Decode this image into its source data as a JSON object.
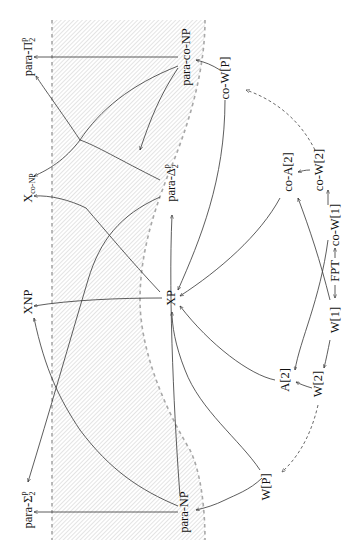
{
  "diagram": {
    "title": "",
    "orientation": "rotated-90",
    "colors": {
      "edge": "#333333",
      "boundary": "#a8a8a8",
      "hatch": "#c8c8c8",
      "text": "#111111"
    },
    "nodes": {
      "para_pi2p": {
        "base": "para-Π",
        "sub": "2",
        "sup": "p"
      },
      "xconp": {
        "label": "X",
        "suffix": "co-NP"
      },
      "xnp": {
        "label": "XNP"
      },
      "para_sigma2p": {
        "base": "para-Σ",
        "sub": "2",
        "sup": "p"
      },
      "para_conp": {
        "label": "para-co-NP"
      },
      "para_delta2p": {
        "base": "para-Δ",
        "sub": "2",
        "sup": "p"
      },
      "xp": {
        "label": "XP"
      },
      "para_np": {
        "label": "para-NP"
      },
      "co_wp": {
        "label": "co-W[P]"
      },
      "co_a2": {
        "label": "co-A[2]"
      },
      "co_w2": {
        "label": "co-W[2]"
      },
      "co_w1": {
        "label": "co-W[1]"
      },
      "fpt": {
        "label": "FPT"
      },
      "w1": {
        "label": "W[1]"
      },
      "a2": {
        "label": "A[2]"
      },
      "w2": {
        "label": "W[2]"
      },
      "wp": {
        "label": "W[P]"
      }
    },
    "edges": [
      {
        "from": "para-co-NP",
        "to": "para-Π2p",
        "style": "solid"
      },
      {
        "from": "para-co-NP",
        "to": "Xco-NP",
        "style": "solid"
      },
      {
        "from": "para-co-NP",
        "to": "para-Δ2p",
        "style": "solid"
      },
      {
        "from": "para-Δ2p",
        "to": "para-Π2p",
        "style": "solid"
      },
      {
        "from": "para-Δ2p",
        "to": "para-Σ2p",
        "style": "solid"
      },
      {
        "from": "XP",
        "to": "Xco-NP",
        "style": "solid"
      },
      {
        "from": "XP",
        "to": "XNP",
        "style": "solid"
      },
      {
        "from": "para-NP",
        "to": "para-Σ2p",
        "style": "solid"
      },
      {
        "from": "para-NP",
        "to": "XNP",
        "style": "solid"
      },
      {
        "from": "para-NP",
        "to": "para-Δ2p",
        "style": "solid"
      },
      {
        "from": "co-W[P]",
        "to": "para-co-NP",
        "style": "solid"
      },
      {
        "from": "co-W[P]",
        "to": "XP",
        "style": "solid"
      },
      {
        "from": "co-W[2]",
        "to": "co-W[P]",
        "style": "dashed"
      },
      {
        "from": "co-W[2]",
        "to": "co-A[2]",
        "style": "solid"
      },
      {
        "from": "co-W[1]",
        "to": "co-W[2]",
        "style": "solid"
      },
      {
        "from": "co-A[2]",
        "to": "XP",
        "style": "solid"
      },
      {
        "from": "FPT",
        "to": "co-W[1]",
        "style": "solid"
      },
      {
        "from": "FPT",
        "to": "W[1]",
        "style": "solid"
      },
      {
        "from": "W[1]",
        "to": "co-A[2]",
        "style": "solid"
      },
      {
        "from": "co-W[1]",
        "to": "A[2]",
        "style": "solid"
      },
      {
        "from": "W[1]",
        "to": "W[2]",
        "style": "solid"
      },
      {
        "from": "W[2]",
        "to": "A[2]",
        "style": "solid"
      },
      {
        "from": "A[2]",
        "to": "XP",
        "style": "solid"
      },
      {
        "from": "W[2]",
        "to": "W[P]",
        "style": "dashed"
      },
      {
        "from": "W[P]",
        "to": "para-NP",
        "style": "solid"
      },
      {
        "from": "W[P]",
        "to": "XP",
        "style": "solid"
      }
    ],
    "shaded_region": {
      "pattern": "diagonal-hatch",
      "bounded_by": "dashed-lines"
    }
  }
}
